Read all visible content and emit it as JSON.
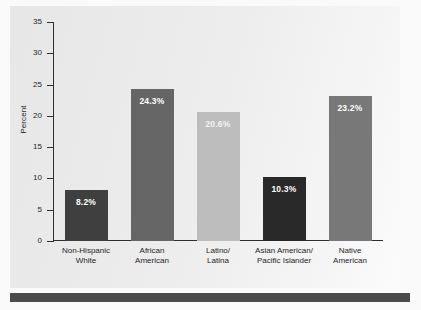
{
  "chart_data": {
    "type": "bar",
    "title": "",
    "xlabel": "",
    "ylabel": "Percent",
    "ylim": [
      0,
      35
    ],
    "yticks": [
      0,
      5,
      10,
      15,
      20,
      25,
      30,
      35
    ],
    "ytick_labels": [
      "0",
      "5",
      "10",
      "15",
      "20",
      "25",
      "30",
      "35"
    ],
    "grid": false,
    "legend": "none",
    "categories": [
      "Non-Hispanic\nWhite",
      "African\nAmerican",
      "Latino/\nLatina",
      "Asian American/\nPacific Islander",
      "Native\nAmerican"
    ],
    "values": [
      8.2,
      24.3,
      20.6,
      10.3,
      23.2
    ],
    "data_labels": [
      "8.2%",
      "24.3%",
      "20.6%",
      "10.3%",
      "23.2%"
    ],
    "bar_colors": [
      "#3f3f3f",
      "#666666",
      "#bdbdbd",
      "#292929",
      "#787878"
    ]
  },
  "axis": {
    "y_title": "Percent",
    "ticks": [
      {
        "label": "35",
        "value": 35
      },
      {
        "label": "30",
        "value": 30
      },
      {
        "label": "25",
        "value": 25
      },
      {
        "label": "20",
        "value": 20
      },
      {
        "label": "15",
        "value": 15
      },
      {
        "label": "10",
        "value": 10
      },
      {
        "label": "5",
        "value": 5
      },
      {
        "label": "0",
        "value": 0
      }
    ]
  },
  "bars": [
    {
      "label_line1": "Non-Hispanic",
      "label_line2": "White",
      "value": 8.2,
      "data_label": "8.2%",
      "color": "#3f3f3f",
      "label_faint": false
    },
    {
      "label_line1": "African",
      "label_line2": "American",
      "value": 24.3,
      "data_label": "24.3%",
      "color": "#666666",
      "label_faint": false
    },
    {
      "label_line1": "Latino/",
      "label_line2": "Latina",
      "value": 20.6,
      "data_label": "20.6%",
      "color": "#bdbdbd",
      "label_faint": true
    },
    {
      "label_line1": "Asian American/",
      "label_line2": "Pacific Islander",
      "value": 10.3,
      "data_label": "10.3%",
      "color": "#292929",
      "label_faint": false
    },
    {
      "label_line1": "Native",
      "label_line2": "American",
      "value": 23.2,
      "data_label": "23.2%",
      "color": "#787878",
      "label_faint": false
    }
  ],
  "colors": {
    "panel_background": "#e9e9e9",
    "figure_background": "#fafafa",
    "axis": "#2e2e2e",
    "bottom_rule": "#4b4b4b",
    "text": "#1e1e1e"
  }
}
